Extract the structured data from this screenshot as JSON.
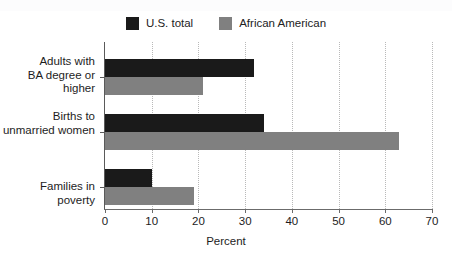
{
  "chart_data": {
    "type": "bar",
    "orientation": "horizontal",
    "title": "",
    "subtitle": "",
    "xlabel": "Percent",
    "ylabel": "",
    "xlim": [
      0,
      70
    ],
    "xticks": [
      0,
      10,
      20,
      30,
      40,
      50,
      60,
      70
    ],
    "xtick_labels": [
      "0",
      "10",
      "20",
      "30",
      "40",
      "50",
      "60",
      "70"
    ],
    "grid": "vertical-dotted",
    "legend_position": "top-center",
    "categories": [
      "Adults with\nBA degree or higher",
      "Births to\nunmarried women",
      "Families in poverty"
    ],
    "series": [
      {
        "name": "U.S. total",
        "color": "#1a1a1a",
        "values": [
          32,
          34,
          10
        ]
      },
      {
        "name": "African American",
        "color": "#808080",
        "values": [
          21,
          63,
          19
        ]
      }
    ]
  },
  "legend": {
    "items": [
      {
        "label": "U.S. total",
        "color": "#1a1a1a"
      },
      {
        "label": "African American",
        "color": "#808080"
      }
    ]
  },
  "axis": {
    "x_title": "Percent",
    "tick_labels": [
      "0",
      "10",
      "20",
      "30",
      "40",
      "50",
      "60",
      "70"
    ]
  },
  "categories": [
    {
      "line1": "Adults with",
      "line2": "BA degree or higher"
    },
    {
      "line1": "Births to",
      "line2": "unmarried women"
    },
    {
      "line1": "Families in poverty",
      "line2": ""
    }
  ]
}
